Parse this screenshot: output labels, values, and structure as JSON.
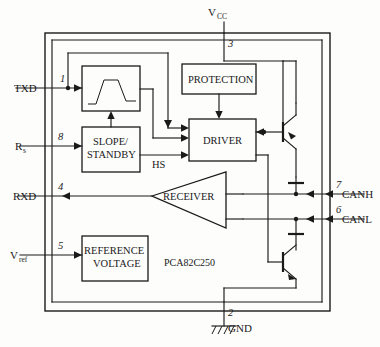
{
  "diagram": {
    "title_part_number": "PCA82C250",
    "blocks": [
      {
        "id": "slope-converter",
        "label": ""
      },
      {
        "id": "protection",
        "label": "PROTECTION"
      },
      {
        "id": "slope-standby",
        "label1": "SLOPE/",
        "label2": "STANDBY"
      },
      {
        "id": "driver",
        "label": "DRIVER"
      },
      {
        "id": "receiver",
        "label": "RECEIVER"
      },
      {
        "id": "reference-voltage",
        "label1": "REFERENCE",
        "label2": "VOLTAGE"
      }
    ],
    "signals": {
      "hs": "HS"
    },
    "pins": [
      {
        "number": "1",
        "name": "TXD",
        "side": "left"
      },
      {
        "number": "8",
        "name": "R",
        "sub": "s",
        "side": "left"
      },
      {
        "number": "4",
        "name": "RXD",
        "side": "left"
      },
      {
        "number": "5",
        "name": "V",
        "sub": "ref",
        "side": "left"
      },
      {
        "number": "3",
        "name": "V",
        "sub": "CC",
        "side": "top"
      },
      {
        "number": "2",
        "name": "GND",
        "side": "bottom"
      },
      {
        "number": "7",
        "name": "CANH",
        "side": "right"
      },
      {
        "number": "6",
        "name": "CANL",
        "side": "right"
      }
    ]
  }
}
